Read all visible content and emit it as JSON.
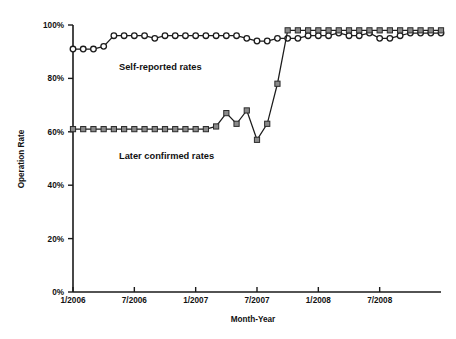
{
  "chart_data": {
    "type": "line",
    "title": "",
    "xlabel": "Month-Year",
    "ylabel": "Operation Rate",
    "grid": false,
    "legend_position": "inline-annotation",
    "ylim": [
      0,
      100
    ],
    "ytick_labels": [
      "0%",
      "20%",
      "40%",
      "60%",
      "80%",
      "100%"
    ],
    "ytick_values": [
      0,
      20,
      40,
      60,
      80,
      100
    ],
    "xtick_labels": [
      "1/2006",
      "7/2006",
      "1/2007",
      "7/2007",
      "1/2008",
      "7/2008"
    ],
    "xtick_values": [
      0,
      6,
      12,
      18,
      24,
      30
    ],
    "xlim": [
      0,
      36
    ],
    "x": [
      0,
      1,
      2,
      3,
      4,
      5,
      6,
      7,
      8,
      9,
      10,
      11,
      12,
      13,
      14,
      15,
      16,
      17,
      18,
      19,
      20,
      21,
      22,
      23,
      24,
      25,
      26,
      27,
      28,
      29,
      30,
      31,
      32,
      33,
      34,
      35,
      36
    ],
    "series": [
      {
        "name": "Self-reported rates",
        "marker": "open-circle",
        "annotation": "Self-reported rates",
        "values": [
          91,
          91,
          91,
          92,
          96,
          96,
          96,
          96,
          95,
          96,
          96,
          96,
          96,
          96,
          96,
          96,
          96,
          95,
          94,
          94,
          95,
          95,
          95,
          96,
          96,
          96,
          97,
          96,
          96,
          97,
          95,
          95,
          96,
          97,
          97,
          97,
          97
        ]
      },
      {
        "name": "Later confirmed rates",
        "marker": "filled-square",
        "annotation": "Later confirmed rates",
        "values": [
          61,
          61,
          61,
          61,
          61,
          61,
          61,
          61,
          61,
          61,
          61,
          61,
          61,
          61,
          62,
          67,
          63,
          68,
          57,
          63,
          78,
          98,
          98,
          98,
          98,
          98,
          98,
          98,
          98,
          98,
          98,
          98,
          98,
          98,
          98,
          98,
          98
        ]
      }
    ],
    "annotations": [
      {
        "text": "Self-reported rates",
        "x": 4.5,
        "y": 83
      },
      {
        "text": "Later confirmed rates",
        "x": 4.5,
        "y": 50
      }
    ],
    "colors": {
      "line": "#1c1c1c",
      "circle_fill": "#ffffff",
      "square_fill": "#8a8a8a",
      "axis": "#1a1a1a",
      "background": "#ffffff"
    }
  }
}
